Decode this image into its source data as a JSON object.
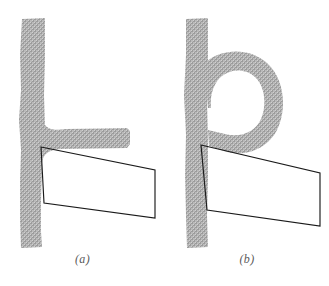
{
  "figure": {
    "background_color": "#ffffff",
    "ink_color": "#1a1a1a",
    "hatch_color": "#9a9a9a",
    "hatch_color_light": "#c4c4c4",
    "caption_color": "#5a5a5a",
    "width": 329,
    "height": 286
  },
  "panels": [
    {
      "id": "a",
      "caption": "(a)",
      "shape_name": "textured-L-form",
      "description": "vertical textured stem with horizontal arm at lower right",
      "overlay_name": "quadrilateral-outline",
      "overlay_vertices": "41,147 155,170 155,218 44,203",
      "stem_top_y": 18,
      "stem_bottom_y": 248,
      "arm_right_x": 130
    },
    {
      "id": "b",
      "caption": "(b)",
      "shape_name": "textured-b-form",
      "description": "vertical textured stem with curled spiral bowl to the right",
      "overlay_name": "quadrilateral-outline",
      "overlay_vertices": "201,145 320,173 320,226 207,210",
      "stem_top_y": 18,
      "stem_bottom_y": 248,
      "spiral_right_x": 285
    }
  ]
}
